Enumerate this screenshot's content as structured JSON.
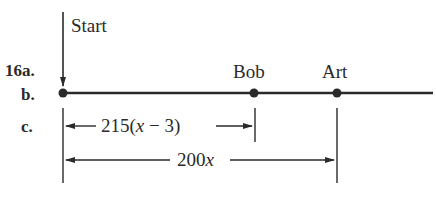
{
  "problem_labels": {
    "a": "16a.",
    "b": "b.",
    "c": "c."
  },
  "start": {
    "label": "Start",
    "x": 63
  },
  "runners": [
    {
      "name": "Bob",
      "x": 254
    },
    {
      "name": "Art",
      "x": 337
    }
  ],
  "measurements": {
    "bob_distance": {
      "coef": "215(",
      "var": "x",
      "rest": " − 3)"
    },
    "art_distance": {
      "coef": "200",
      "var": "x"
    }
  },
  "colors": {
    "ink": "#2a2a2a",
    "background": "#ffffff"
  }
}
